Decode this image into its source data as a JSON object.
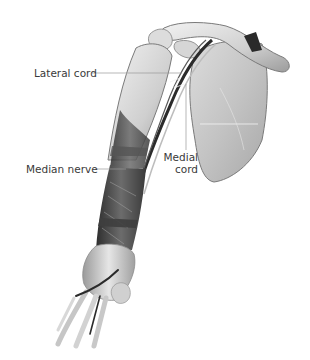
{
  "figure": {
    "labels": {
      "lateral_cord": "Lateral cord",
      "median_nerve": "Median nerve",
      "medial_cord_line1": "Medial",
      "medial_cord_line2": "cord"
    }
  },
  "colors": {
    "background": "#ffffff",
    "bone_light": "#e4e4e4",
    "bone_mid": "#bdbdbd",
    "muscle_dark": "#4a4a4a",
    "nerve_dark": "#2b2b2b",
    "leader_line": "#9a9a9a",
    "label_text": "#3a3a3a"
  }
}
